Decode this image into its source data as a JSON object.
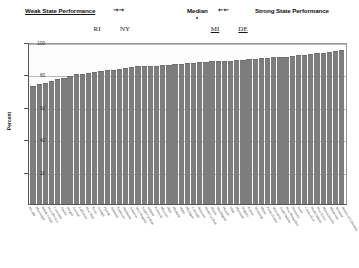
{
  "annotations": {
    "weak_label": "Weak State Performance",
    "weak_arrows": "→→",
    "median_label": "Median",
    "median_arrows": "←←",
    "strong_label": "Strong State Performance"
  },
  "callouts": [
    {
      "label": "RI",
      "x": 97,
      "underlined": false
    },
    {
      "label": "NY",
      "x": 125,
      "underlined": false
    },
    {
      "label": "MI",
      "x": 215,
      "underlined": true
    },
    {
      "label": "DE",
      "x": 243,
      "underlined": true
    }
  ],
  "colors": {
    "bar": "#7d7d7d",
    "gridline": "#b9b9b9",
    "axis": "#555555",
    "text": "#111111"
  },
  "chart_data": {
    "type": "bar",
    "title": "",
    "xlabel": "",
    "ylabel": "Percent",
    "ylim": [
      0,
      100
    ],
    "yticks": [
      20,
      40,
      60,
      80,
      100
    ],
    "ytick_labels": [
      "20",
      "40",
      "60",
      "80",
      "100"
    ],
    "grid": true,
    "legend": "none",
    "sorted": "ascending",
    "categories": [
      "Nevada",
      "Mississippi",
      "Rhode Island",
      "New Mexico",
      "Louisiana",
      "Alaska",
      "Oregon",
      "Arizona",
      "California",
      "New York",
      "Texas",
      "Georgia",
      "Florida",
      "Alabama",
      "Tennessee",
      "Oklahoma",
      "Arkansas",
      "West Virginia",
      "South Carolina",
      "Indiana",
      "Kentucky",
      "Missouri",
      "Ohio",
      "Montana",
      "Idaho",
      "Michigan",
      "Colorado",
      "Delaware",
      "North Carolina",
      "Illinois",
      "Washington",
      "Hawaii",
      "Utah",
      "Maryland",
      "Virginia",
      "Kansas",
      "Wyoming",
      "Maine",
      "Pennsylvania",
      "Wisconsin",
      "South Dakota",
      "New Hampshire",
      "Nebraska",
      "Iowa",
      "Connecticut",
      "North Dakota",
      "New Jersey",
      "Massachusetts",
      "Minnesota",
      "Vermont",
      "District of Columbia"
    ],
    "values": [
      73,
      74,
      75,
      76,
      77,
      78,
      79,
      80,
      80.5,
      81,
      81.5,
      82,
      82.5,
      83,
      83.5,
      84,
      84.5,
      85,
      85,
      85.5,
      85.5,
      86,
      86,
      86.5,
      86.5,
      87,
      87,
      87.5,
      87.5,
      88,
      88,
      88.5,
      88.5,
      89,
      89,
      89.5,
      89.5,
      90,
      90,
      90.5,
      91,
      91,
      91.5,
      92,
      92,
      92.5,
      93,
      93.5,
      94,
      94.5,
      95
    ]
  }
}
